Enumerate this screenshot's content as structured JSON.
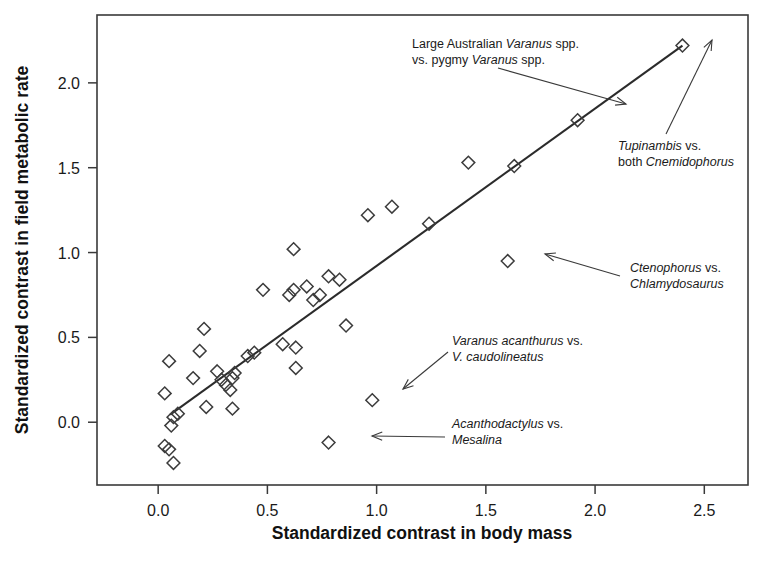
{
  "chart_data": {
    "type": "scatter",
    "title": "",
    "xlabel": "Standardized contrast in body mass",
    "ylabel": "Standardized contrast in  field metabolic rate",
    "xlim": [
      -0.28,
      2.7
    ],
    "ylim": [
      -0.37,
      2.4
    ],
    "xticks": [
      0.0,
      0.5,
      1.0,
      1.5,
      2.0,
      2.5
    ],
    "xtick_labels": [
      "0.0",
      "0.5",
      "1.0",
      "1.5",
      "2.0",
      "2.5"
    ],
    "yticks": [
      0.0,
      0.5,
      1.0,
      1.5,
      2.0
    ],
    "ytick_labels": [
      "0.0",
      "0.5",
      "1.0",
      "1.5",
      "2.0"
    ],
    "grid": false,
    "legend": "none",
    "marker": "open-diamond",
    "points": [
      {
        "x": 0.03,
        "y": -0.14
      },
      {
        "x": 0.05,
        "y": -0.16
      },
      {
        "x": 0.07,
        "y": -0.24
      },
      {
        "x": 0.03,
        "y": 0.17
      },
      {
        "x": 0.05,
        "y": 0.36
      },
      {
        "x": 0.06,
        "y": -0.02
      },
      {
        "x": 0.07,
        "y": 0.03
      },
      {
        "x": 0.09,
        "y": 0.05
      },
      {
        "x": 0.16,
        "y": 0.26
      },
      {
        "x": 0.19,
        "y": 0.42
      },
      {
        "x": 0.21,
        "y": 0.55
      },
      {
        "x": 0.22,
        "y": 0.09
      },
      {
        "x": 0.27,
        "y": 0.3
      },
      {
        "x": 0.29,
        "y": 0.25
      },
      {
        "x": 0.31,
        "y": 0.22
      },
      {
        "x": 0.33,
        "y": 0.19
      },
      {
        "x": 0.34,
        "y": 0.26
      },
      {
        "x": 0.35,
        "y": 0.29
      },
      {
        "x": 0.34,
        "y": 0.08
      },
      {
        "x": 0.41,
        "y": 0.39
      },
      {
        "x": 0.44,
        "y": 0.41
      },
      {
        "x": 0.48,
        "y": 0.78
      },
      {
        "x": 0.57,
        "y": 0.46
      },
      {
        "x": 0.6,
        "y": 0.75
      },
      {
        "x": 0.62,
        "y": 0.78
      },
      {
        "x": 0.62,
        "y": 1.02
      },
      {
        "x": 0.63,
        "y": 0.32
      },
      {
        "x": 0.63,
        "y": 0.44
      },
      {
        "x": 0.68,
        "y": 0.8
      },
      {
        "x": 0.71,
        "y": 0.72
      },
      {
        "x": 0.74,
        "y": 0.75
      },
      {
        "x": 0.78,
        "y": 0.86
      },
      {
        "x": 0.83,
        "y": 0.84
      },
      {
        "x": 0.86,
        "y": 0.57
      },
      {
        "x": 0.78,
        "y": -0.12
      },
      {
        "x": 0.96,
        "y": 1.22
      },
      {
        "x": 1.07,
        "y": 1.27
      },
      {
        "x": 0.98,
        "y": 0.13
      },
      {
        "x": 1.24,
        "y": 1.17
      },
      {
        "x": 1.42,
        "y": 1.53
      },
      {
        "x": 1.63,
        "y": 1.51
      },
      {
        "x": 1.6,
        "y": 0.95
      },
      {
        "x": 1.92,
        "y": 1.78
      },
      {
        "x": 2.4,
        "y": 2.22
      }
    ],
    "regression_line": {
      "x0": 0.055,
      "y0": 0.045,
      "x1": 2.4,
      "y1": 2.22
    },
    "annotations": [
      {
        "id": "large-australian-varanus",
        "lines": [
          [
            {
              "t": "Large Australian ",
              "i": false
            },
            {
              "t": "Varanus",
              "i": true
            },
            {
              "t": " spp.",
              "i": false
            }
          ],
          [
            {
              "t": "vs. pygmy ",
              "i": false
            },
            {
              "t": "Varanus",
              "i": true
            },
            {
              "t": " spp.",
              "i": false
            }
          ]
        ],
        "text_x": 412,
        "text_y": 48,
        "arrow": {
          "x1": 498,
          "y1": 68,
          "x2": 626,
          "y2": 104
        }
      },
      {
        "id": "tupinambis-cnemidophorus",
        "lines": [
          [
            {
              "t": "Tupinambis",
              "i": true
            },
            {
              "t": " vs.",
              "i": false
            }
          ],
          [
            {
              "t": "both ",
              "i": false
            },
            {
              "t": "Cnemidophorus",
              "i": true
            }
          ]
        ],
        "text_x": 618,
        "text_y": 150,
        "arrow": {
          "x1": 666,
          "y1": 134,
          "x2": 712,
          "y2": 40
        }
      },
      {
        "id": "ctenophorus-chlamydosaurus",
        "lines": [
          [
            {
              "t": "Ctenophorus",
              "i": true
            },
            {
              "t": " vs.",
              "i": false
            }
          ],
          [
            {
              "t": "Chlamydosaurus",
              "i": true
            }
          ]
        ],
        "text_x": 630,
        "text_y": 272,
        "arrow": {
          "x1": 620,
          "y1": 276,
          "x2": 545,
          "y2": 254
        }
      },
      {
        "id": "varanus-acanthurus-caudolineatus",
        "lines": [
          [
            {
              "t": "Varanus acanthurus",
              "i": true
            },
            {
              "t": " vs.",
              "i": false
            }
          ],
          [
            {
              "t": "V. caudolineatus",
              "i": true
            }
          ]
        ],
        "text_x": 452,
        "text_y": 345,
        "arrow": {
          "x1": 448,
          "y1": 352,
          "x2": 403,
          "y2": 389
        }
      },
      {
        "id": "acanthodactylus-mesalina",
        "lines": [
          [
            {
              "t": "Acanthodactylus",
              "i": true
            },
            {
              "t": " vs.",
              "i": false
            }
          ],
          [
            {
              "t": "Mesalina",
              "i": true
            }
          ]
        ],
        "text_x": 452,
        "text_y": 428,
        "arrow": {
          "x1": 445,
          "y1": 437,
          "x2": 372,
          "y2": 436
        }
      }
    ]
  }
}
